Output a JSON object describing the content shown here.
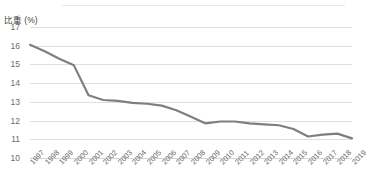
{
  "chart_data": {
    "type": "line",
    "title": "",
    "ylabel": "比重 (%)",
    "xlabel": "",
    "ylim": [
      10,
      17
    ],
    "yticks": [
      17,
      16,
      15,
      14,
      13,
      12,
      11,
      10
    ],
    "grid": true,
    "legend": "none",
    "line_color": "#7f7f7f",
    "grid_color": "#dedede",
    "categories": [
      "1997",
      "1998",
      "1999",
      "2000",
      "2001",
      "2002",
      "2003",
      "2004",
      "2005",
      "2006",
      "2007",
      "2008",
      "2009",
      "2010",
      "2011",
      "2012",
      "2013",
      "2014",
      "2015",
      "2016",
      "2017",
      "2018",
      "2019"
    ],
    "series": [
      {
        "name": "比重",
        "values": [
          16.05,
          15.7,
          15.3,
          14.95,
          13.35,
          13.1,
          13.05,
          12.95,
          12.9,
          12.8,
          12.55,
          12.2,
          11.85,
          11.95,
          11.95,
          11.85,
          11.8,
          11.75,
          11.55,
          11.15,
          11.25,
          11.3,
          11.05
        ]
      }
    ]
  }
}
